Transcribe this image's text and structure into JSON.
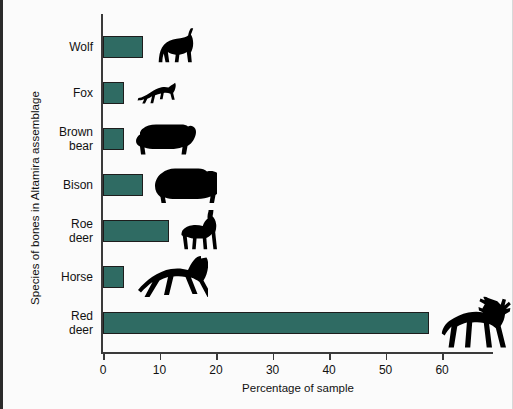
{
  "chart_data": {
    "type": "bar",
    "orientation": "horizontal",
    "title": "",
    "xlabel": "Percentage of sample",
    "ylabel": "Species of bones in Altamira assemblage",
    "categories": [
      "Wolf",
      "Fox",
      "Brown bear",
      "Bison",
      "Roe deer",
      "Horse",
      "Red deer"
    ],
    "values": [
      7.1,
      3.7,
      3.7,
      7.1,
      11.6,
      3.7,
      57.6
    ],
    "xlim": [
      0,
      69
    ],
    "xticks": [
      0,
      10,
      20,
      30,
      40,
      50,
      60
    ],
    "xticklabels": [
      "0",
      "10",
      "20",
      "30",
      "40",
      "50",
      "60"
    ],
    "grid": false,
    "legend": false,
    "bar_color": "#2f6b63",
    "bar_edge_color": "#1d1d1d",
    "icons": [
      "wolf-icon",
      "fox-icon",
      "brown-bear-icon",
      "bison-icon",
      "roe-deer-icon",
      "horse-icon",
      "red-deer-icon"
    ]
  },
  "figure": {
    "background": "#fbfbfb",
    "axis_color": "#3a3a3a"
  }
}
